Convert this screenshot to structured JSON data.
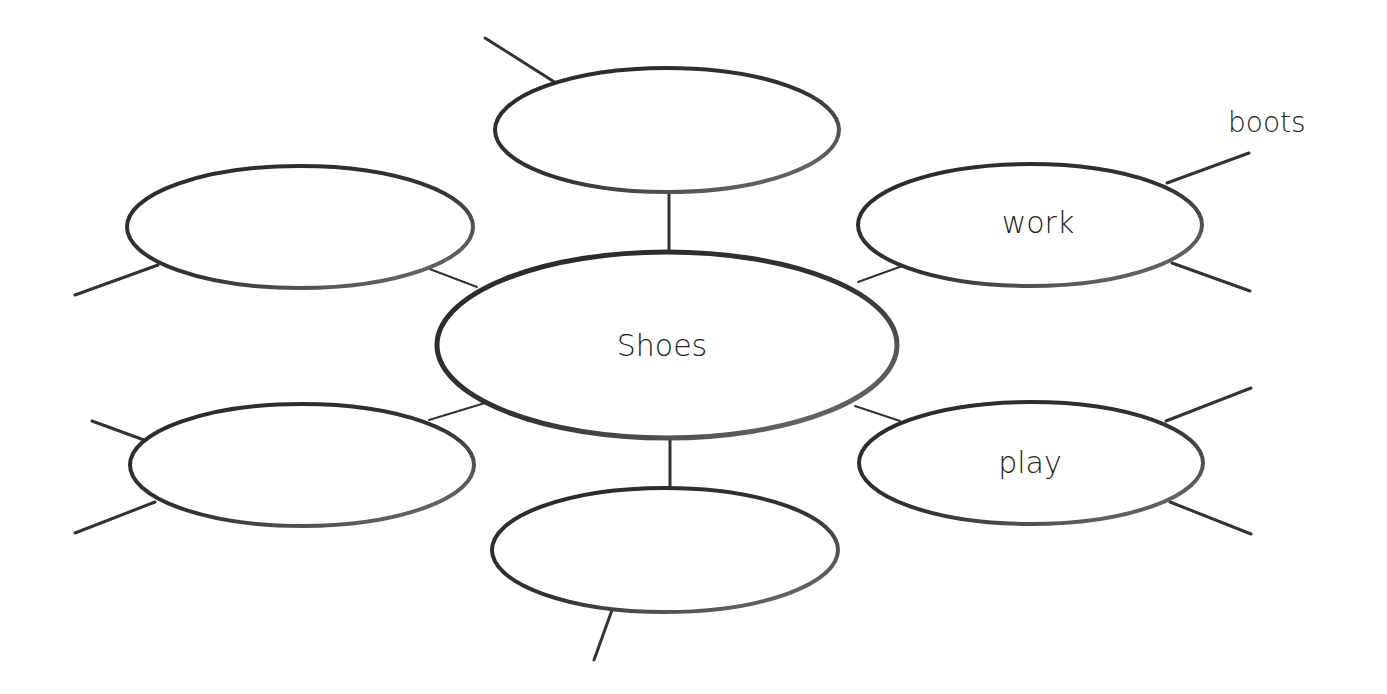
{
  "diagram": {
    "type": "word-web",
    "center": {
      "label": "Shoes"
    },
    "nodes": [
      {
        "id": "top",
        "label": ""
      },
      {
        "id": "upper-left",
        "label": ""
      },
      {
        "id": "lower-left",
        "label": ""
      },
      {
        "id": "bottom",
        "label": ""
      },
      {
        "id": "upper-right",
        "label": "work"
      },
      {
        "id": "lower-right",
        "label": "play"
      }
    ],
    "branch_labels": [
      {
        "attached_to": "upper-right",
        "label": "boots"
      }
    ],
    "colors": {
      "stroke": "#333333",
      "text": "#222222",
      "background": "#ffffff"
    }
  }
}
